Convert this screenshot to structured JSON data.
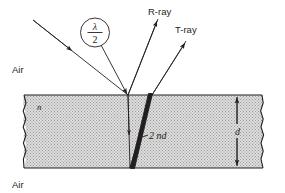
{
  "figure": {
    "medium_top_label": "Air",
    "medium_bottom_label": "Air",
    "slab_index_label": "n",
    "thickness_label": "d",
    "path_difference_label": "2 nd",
    "reflected_ray_label": "R-ray",
    "transmitted_ray_label": "T-ray",
    "phase_shift_numerator": "λ",
    "phase_shift_denominator": "2",
    "colors": {
      "ink": "#231f20",
      "slab_fill": "#d9d9d9",
      "background": "#ffffff"
    }
  }
}
